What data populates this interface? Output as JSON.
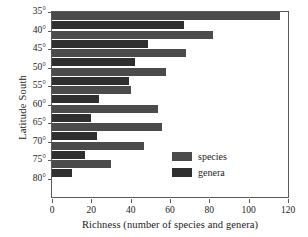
{
  "chart_data": {
    "type": "bar",
    "orientation": "horizontal",
    "title": "",
    "xlabel": "Richness (number of species and genera)",
    "ylabel": "Latitude South",
    "categories": [
      "35°",
      "40°",
      "45°",
      "50°",
      "55°",
      "60°",
      "65°",
      "70°",
      "75°",
      "80°"
    ],
    "series": [
      {
        "name": "species",
        "color": "#4b4b4b",
        "values": [
          116,
          82,
          68,
          58,
          40,
          54,
          56,
          47,
          30,
          null
        ]
      },
      {
        "name": "genera",
        "color": "#2f2f2f",
        "values": [
          67,
          49,
          42,
          39,
          24,
          20,
          23,
          17,
          10,
          null
        ]
      }
    ],
    "xlim": [
      0,
      120
    ],
    "xticks": [
      0,
      20,
      40,
      60,
      80,
      100,
      120
    ],
    "xticklabels": [
      "0",
      "20",
      "40",
      "60",
      "80",
      "100",
      "120"
    ],
    "grid": false,
    "legend_position": "lower-right",
    "legend_entries": [
      "species",
      "genera"
    ],
    "axis_color": "#5a5a5a",
    "background": "#ffffff"
  },
  "legend": {
    "species_label": "species",
    "genera_label": "genera"
  }
}
